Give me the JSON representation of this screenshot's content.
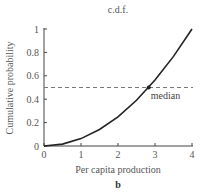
{
  "chart_data": {
    "type": "line",
    "title": "c.d.f.",
    "xlabel": "Per capita production",
    "ylabel": "Cumulative probability",
    "panel_label": "b",
    "xlim": [
      0,
      4
    ],
    "ylim": [
      0,
      1
    ],
    "x_ticks": [
      "0",
      "1",
      "2",
      "3",
      "4"
    ],
    "y_ticks": [
      "0",
      "0.2",
      "0.4",
      "0.6",
      "0.8",
      "1"
    ],
    "grid": false,
    "legend": null,
    "series": [
      {
        "name": "c.d.f.",
        "style": "solid",
        "color": "#222222",
        "x": [
          0,
          0.5,
          1,
          1.5,
          2,
          2.5,
          3,
          3.5,
          4
        ],
        "values": [
          0,
          0.016,
          0.063,
          0.141,
          0.25,
          0.391,
          0.563,
          0.766,
          1.0
        ]
      },
      {
        "name": "median line",
        "style": "dashed",
        "color": "#777777",
        "x": [
          0,
          4
        ],
        "values": [
          0.5,
          0.5
        ]
      }
    ],
    "annotations": [
      {
        "text": "median",
        "x": 2.83,
        "y": 0.5,
        "marker": "point"
      }
    ]
  }
}
